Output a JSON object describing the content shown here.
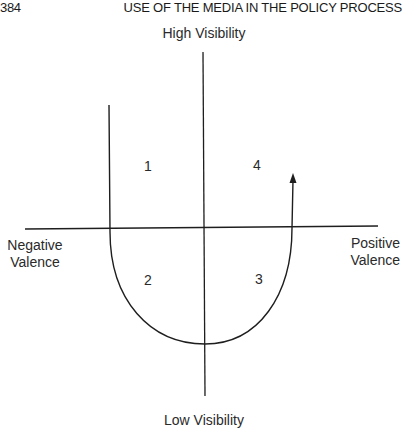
{
  "header": {
    "page_number": "384",
    "running_head": "USE OF THE MEDIA IN THE POLICY PROCESS"
  },
  "diagram": {
    "axes": {
      "top_label": "High Visibility",
      "bottom_label": "Low Visibility",
      "left_label_line1": "Negative",
      "left_label_line2": "Valence",
      "right_label_line1": "Positive",
      "right_label_line2": "Valence"
    },
    "quadrants": [
      {
        "number": "1",
        "position": "upper-left"
      },
      {
        "number": "2",
        "position": "lower-left"
      },
      {
        "number": "3",
        "position": "lower-right"
      },
      {
        "number": "4",
        "position": "upper-right"
      }
    ],
    "curve": {
      "shape": "U-shaped path",
      "start": "upper-left quadrant (high visibility, negative valence)",
      "end": "upper-right quadrant with arrowhead (high visibility, positive valence)"
    },
    "colors": {
      "line": "#1e1e1e",
      "background": "#ffffff"
    }
  }
}
